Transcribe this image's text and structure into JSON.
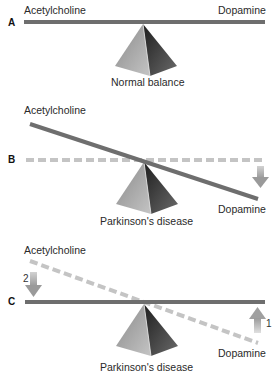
{
  "panels": [
    {
      "letter": "A",
      "left_label": "Acetylcholine",
      "right_label": "Dopamine",
      "caption": "Normal balance"
    },
    {
      "letter": "B",
      "left_label": "Acetylcholine",
      "right_label": "Dopamine",
      "caption": "Parkinson's disease"
    },
    {
      "letter": "C",
      "left_label": "Acetylcholine",
      "right_label": "Dopamine",
      "caption": "Parkinson's disease",
      "arrow_left_number": "2",
      "arrow_right_number": "1"
    }
  ],
  "colors": {
    "beam": "#6e6e6e",
    "beam_dashed": "#c4c4c4",
    "arrow": "#b5b5b5",
    "pyramid_light": "#a8a8a8",
    "pyramid_dark": "#3c3c3c"
  }
}
